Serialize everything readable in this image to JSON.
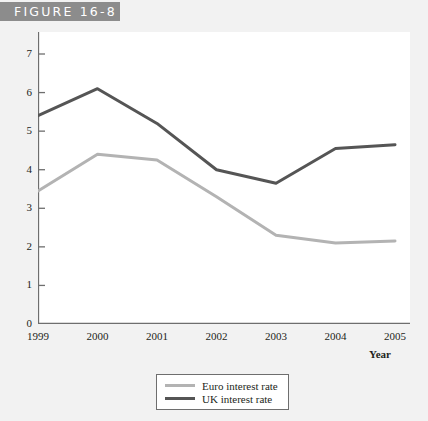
{
  "figure": {
    "label": "FIGURE 16-8"
  },
  "legend": {
    "items": [
      {
        "name": "Euro interest rate",
        "color": "#b3b3b3"
      },
      {
        "name": "UK interest rate",
        "color": "#555555"
      }
    ]
  },
  "axes": {
    "x_title": "Year",
    "x_ticks": [
      "1999",
      "2000",
      "2001",
      "2002",
      "2003",
      "2004",
      "2005"
    ],
    "y_ticks": [
      "0",
      "1",
      "2",
      "3",
      "4",
      "5",
      "6",
      "7"
    ]
  },
  "chart_data": {
    "type": "line",
    "title": "FIGURE 16-8",
    "xlabel": "Year",
    "ylabel": "",
    "categories": [
      "1999",
      "2000",
      "2001",
      "2002",
      "2003",
      "2004",
      "2005"
    ],
    "x": [
      1999,
      2000,
      2001,
      2002,
      2003,
      2004,
      2005
    ],
    "xlim": [
      1999,
      2005
    ],
    "ylim": [
      0,
      7
    ],
    "grid": false,
    "legend_position": "bottom",
    "series": [
      {
        "name": "Euro interest rate",
        "color": "#b3b3b3",
        "values": [
          3.45,
          4.4,
          4.25,
          3.3,
          2.3,
          2.1,
          2.15
        ]
      },
      {
        "name": "UK interest rate",
        "color": "#555555",
        "values": [
          5.4,
          6.1,
          5.2,
          4.0,
          3.65,
          4.55,
          4.65
        ]
      }
    ]
  }
}
